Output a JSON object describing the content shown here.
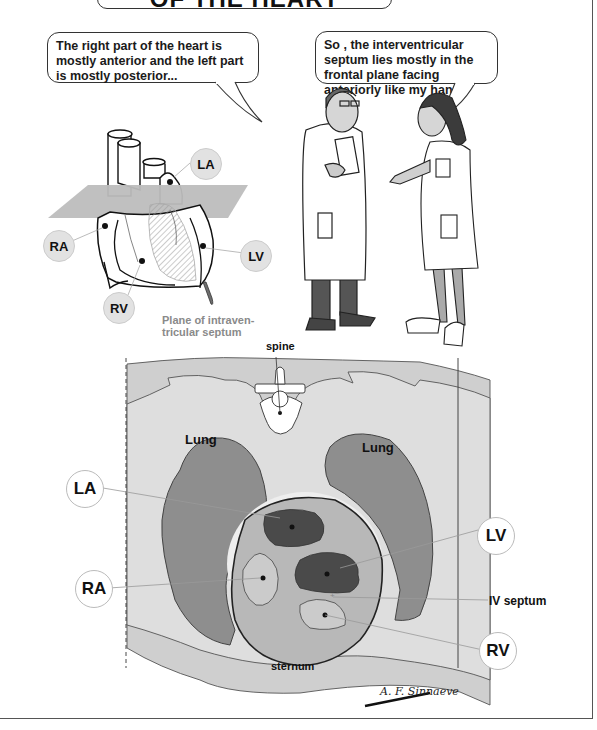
{
  "title": "OF THE HEART",
  "speech": {
    "doctor": "The right part of the heart is mostly anterior and the left part is mostly posterior...",
    "nurse": "So , the interventricular septum lies mostly in the frontal plane facing anteriorly like my hand !"
  },
  "heart_diagram": {
    "labels": {
      "la": "LA",
      "ra": "RA",
      "lv": "LV",
      "rv": "RV"
    },
    "caption_line1": "Plane of intraven-",
    "caption_line2": "tricular septum"
  },
  "cross_section": {
    "spine": "spine",
    "lung_left": "Lung",
    "lung_right": "Lung",
    "sternum": "sternum",
    "iv_septum": "IV septum",
    "labels": {
      "la": "LA",
      "lv": "LV",
      "ra": "RA",
      "rv": "RV"
    }
  },
  "signature": "A. F. Sinnaeve",
  "colors": {
    "outer_tissue": "#cfcfcf",
    "inner_tissue": "#dcdcdc",
    "lung": "#8e8e8e",
    "pericardium": "#b5b5b5",
    "left_chambers": "#4a4a4a",
    "right_chambers": "#c9c9c9",
    "plane": "#b9b9b9"
  }
}
